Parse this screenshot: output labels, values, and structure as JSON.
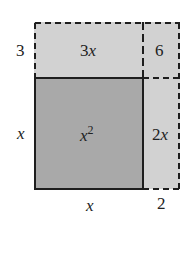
{
  "diagram": {
    "title": "",
    "regions": {
      "x_squared": {
        "label_base": "x",
        "label_exp": "2",
        "fill": "#a9a9a9"
      },
      "top_strip": {
        "label_num": "3",
        "label_var": "x",
        "fill": "#d2d2d2"
      },
      "corner": {
        "label": "6",
        "fill": "#d2d2d2"
      },
      "right_strip": {
        "label_num": "2",
        "label_var": "x",
        "fill": "#d2d2d2"
      }
    },
    "dimensions": {
      "left_top": "3",
      "left_bottom": "x",
      "bottom_left": "x",
      "bottom_right": "2"
    },
    "colors": {
      "line": "#1e1e1e",
      "background": "#ffffff"
    }
  }
}
